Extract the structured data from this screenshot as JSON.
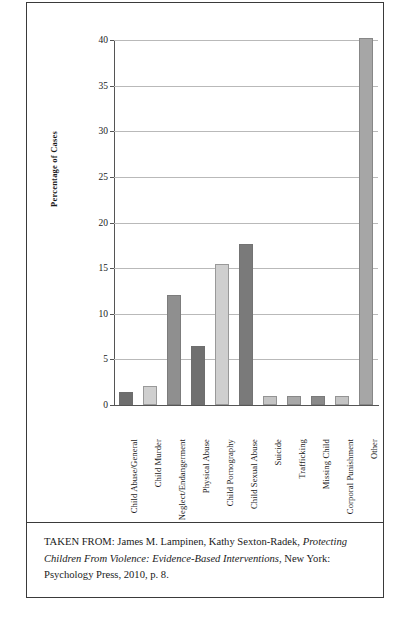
{
  "page": {
    "title_sliver": "·  ·   ·     ·    ·"
  },
  "chart_data": {
    "type": "bar",
    "title": "",
    "xlabel": "",
    "ylabel": "Percentage of Cases",
    "ylim": [
      0,
      40
    ],
    "ytick_step": 5,
    "ytick_labels": [
      "0",
      "5",
      "10",
      "15",
      "20",
      "25",
      "30",
      "35",
      "40"
    ],
    "grid": true,
    "legend": "none",
    "categories": [
      "Child Abuse/General",
      "Child Murder",
      "Neglect/Endangerment",
      "Physical Abuse",
      "Child Pornography",
      "Child Sexual Abuse",
      "Suicide",
      "Trafficking",
      "Missing Child",
      "Corporal Punishment",
      "Other"
    ],
    "values": [
      1.4,
      2.1,
      12.1,
      6.5,
      15.5,
      17.6,
      1.0,
      1.0,
      1.0,
      1.0,
      40.2
    ],
    "bar_colors": [
      "#6e6e6e",
      "#cfcfcf",
      "#8f8f8f",
      "#707070",
      "#cfcfcf",
      "#7a7a7a",
      "#c4c4c4",
      "#a8a8a8",
      "#8a8a8a",
      "#c4c4c4",
      "#a6a6a6"
    ]
  },
  "caption": {
    "lead": "TAKEN FROM: James M. Lampinen, Kathy Sexton-Radek, ",
    "work_title": "Protecting Children From Violence: Evidence-Based Interventions",
    "tail": ", New York: Psychology Press, 2010, p. 8."
  }
}
